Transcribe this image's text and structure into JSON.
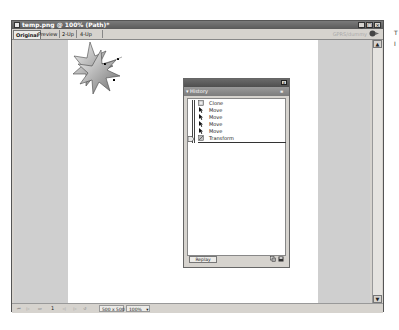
{
  "window": {
    "title": "temp.png @ 100% (Path)*",
    "buttons": {
      "minimize": "_",
      "maximize": "□",
      "close": "×"
    }
  },
  "tabs": [
    {
      "label": "Original",
      "active": true
    },
    {
      "label": "Preview",
      "active": false
    },
    {
      "label": "2-Up",
      "active": false
    },
    {
      "label": "4-Up",
      "active": false
    }
  ],
  "toolbar_right": {
    "text": "GPRS/dummy",
    "icon": "preview-gear-icon"
  },
  "status_bar": {
    "page": "1",
    "size": "500 x 500",
    "zoom": "100%",
    "zoom_arrow": "▾"
  },
  "history_panel": {
    "tab_label": "History",
    "tab_arrow": "▾",
    "menu_icon": "≡",
    "close_label": "x",
    "items": [
      {
        "label": "Clone",
        "icon": "clone-icon"
      },
      {
        "label": "Move",
        "icon": "arrow-pointer-icon"
      },
      {
        "label": "Move",
        "icon": "arrow-pointer-icon"
      },
      {
        "label": "Move",
        "icon": "arrow-pointer-icon"
      },
      {
        "label": "Move",
        "icon": "arrow-pointer-icon"
      },
      {
        "label": "Transform",
        "icon": "transform-icon"
      }
    ],
    "replay_label": "Replay"
  },
  "side_marks": [
    "T",
    "I"
  ],
  "colors": {
    "titlebar": "#5a5a5a",
    "chrome": "#d6d3ce",
    "canvas_bg": "#cfcfcf",
    "document": "#ffffff"
  }
}
